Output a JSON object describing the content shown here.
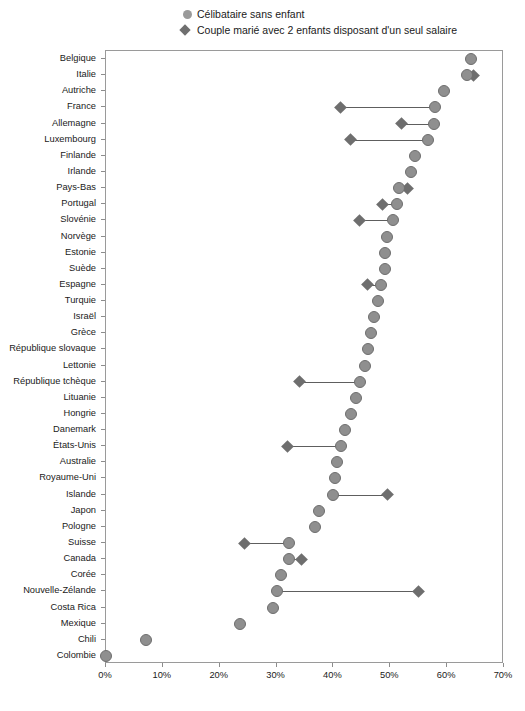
{
  "legend": {
    "items": [
      {
        "marker": "circle-marker",
        "label": "Célibataire sans enfant"
      },
      {
        "marker": "diamond-marker",
        "label": "Couple marié avec 2 enfants disposant d'un seul salaire"
      }
    ]
  },
  "colors": {
    "circle": "#8f8f8f",
    "diamond": "#6e6e6e",
    "connector": "#5e5e5e",
    "axis": "#9a9a9a",
    "text": "#1a1a1a"
  },
  "axis": {
    "x_ticks": [
      "0%",
      "10%",
      "20%",
      "30%",
      "40%",
      "50%",
      "60%",
      "70%"
    ],
    "x_min": 0,
    "x_max": 70
  },
  "chart_data": {
    "type": "scatter",
    "title": "",
    "subtitle": "",
    "xlabel": "",
    "ylabel": "",
    "xlim": [
      0,
      70
    ],
    "grid": false,
    "legend_position": "top",
    "categories": [
      "Belgique",
      "Italie",
      "Autriche",
      "France",
      "Allemagne",
      "Luxembourg",
      "Finlande",
      "Irlande",
      "Pays-Bas",
      "Portugal",
      "Slovénie",
      "Norvège",
      "Estonie",
      "Suède",
      "Espagne",
      "Turquie",
      "Israël",
      "Grèce",
      "République slovaque",
      "Lettonie",
      "République tchèque",
      "Lituanie",
      "Hongrie",
      "Danemark",
      "États-Unis",
      "Australie",
      "Royaume-Uni",
      "Islande",
      "Japon",
      "Pologne",
      "Suisse",
      "Canada",
      "Corée",
      "Nouvelle-Zélande",
      "Costa Rica",
      "Mexique",
      "Chili",
      "Colombie"
    ],
    "series": [
      {
        "name": "Célibataire sans enfant",
        "marker": "circle",
        "values": [
          64.2,
          63.5,
          59.4,
          57.8,
          57.7,
          56.7,
          54.3,
          53.6,
          51.5,
          51.2,
          50.5,
          49.4,
          49.1,
          49.0,
          48.4,
          47.8,
          47.2,
          46.6,
          46.0,
          45.5,
          44.7,
          44.0,
          43.1,
          42.1,
          41.3,
          40.7,
          40.3,
          40.0,
          37.5,
          36.8,
          32.2,
          32.1,
          30.7,
          30.1,
          29.3,
          23.5,
          7.0,
          0.0
        ]
      },
      {
        "name": "Couple marié avec 2 enfants disposant d'un seul salaire",
        "marker": "diamond",
        "values": [
          null,
          64.6,
          null,
          41.3,
          52.0,
          43.0,
          null,
          null,
          53.1,
          48.7,
          44.5,
          null,
          null,
          null,
          46.0,
          null,
          null,
          null,
          null,
          null,
          34.0,
          null,
          null,
          null,
          32.0,
          null,
          null,
          49.5,
          null,
          null,
          24.4,
          34.4,
          null,
          55.0,
          null,
          null,
          null,
          null
        ]
      }
    ]
  }
}
